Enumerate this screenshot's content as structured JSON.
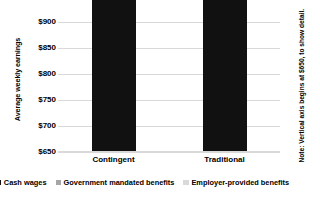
{
  "chart_data": {
    "type": "bar",
    "stacked": true,
    "title": "",
    "xlabel": "",
    "ylabel": "Average weekly earnings",
    "categories": [
      "Contingent",
      "Traditional"
    ],
    "series": [
      {
        "name": "Cash wages",
        "color": "#111111",
        "values": [
          735,
          712
        ]
      },
      {
        "name": "Government mandated benefits",
        "color": "#a6a6a6",
        "values": [
          23,
          99
        ]
      },
      {
        "name": "Employer-provided benefits",
        "color": "#d9d9d9",
        "values": [
          11,
          70
        ]
      }
    ],
    "totals": [
      769,
      881
    ],
    "ylim": [
      650,
      900
    ],
    "yticks": [
      "$650",
      "$700",
      "$750",
      "$800",
      "$850",
      "$900"
    ],
    "ytick_values": [
      650,
      700,
      750,
      800,
      850,
      900
    ],
    "grid": true,
    "legend_position": "bottom",
    "annotation": "Note: Vertical axis begins at $650, to show detail."
  },
  "axis": {
    "y_title": "Average weekly earnings",
    "ticks": [
      {
        "label": "$900",
        "value": 900
      },
      {
        "label": "$850",
        "value": 850
      },
      {
        "label": "$800",
        "value": 800
      },
      {
        "label": "$750",
        "value": 750
      },
      {
        "label": "$700",
        "value": 700
      },
      {
        "label": "$650",
        "value": 650
      }
    ],
    "categories": [
      {
        "label": "Contingent"
      },
      {
        "label": "Traditional"
      }
    ]
  },
  "legend": {
    "items": [
      {
        "label": "Cash wages",
        "color": "#111111"
      },
      {
        "label": "Government mandated benefits",
        "color": "#a6a6a6"
      },
      {
        "label": "Employer-provided benefits",
        "color": "#d9d9d9"
      }
    ]
  },
  "note": {
    "text": "Note: Vertical axis begins at $650, to show detail."
  }
}
